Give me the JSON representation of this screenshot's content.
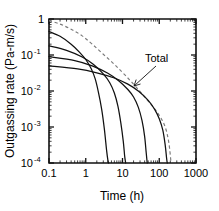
{
  "chart_data": {
    "type": "line",
    "title": "",
    "xlabel": "Time (h)",
    "ylabel": "Outgassing rate (Pa-m/s)",
    "xscale": "log",
    "yscale": "log",
    "xlim": [
      0.1,
      1000
    ],
    "ylim": [
      0.0001,
      1
    ],
    "grid": false,
    "legend": "none",
    "xticks": [
      "0.1",
      "1",
      "10",
      "100",
      "1000"
    ],
    "xtick_values": [
      0.1,
      1,
      10,
      100,
      1000
    ],
    "ytick_labels": [
      "1",
      "10",
      "10",
      "10",
      "10"
    ],
    "ytick_exponents": [
      "",
      "-1",
      "-2",
      "-3",
      "-4"
    ],
    "ytick_values": [
      1,
      0.1,
      0.01,
      0.001,
      0.0001
    ],
    "annotations": [
      {
        "text": "Total",
        "points_to": "dashed total curve",
        "x": 30,
        "y": 0.028
      }
    ],
    "series": [
      {
        "name": "Total",
        "style": "dashed",
        "color": "#7a7a7a",
        "x": [
          0.1,
          0.2,
          0.4,
          0.8,
          1.5,
          3,
          6,
          12,
          25,
          50,
          90,
          140,
          180,
          210
        ],
        "y": [
          0.9,
          0.72,
          0.52,
          0.34,
          0.2,
          0.105,
          0.055,
          0.027,
          0.012,
          0.0052,
          0.0025,
          0.0011,
          0.0004,
          0.0001
        ]
      },
      {
        "name": "component-1",
        "style": "solid",
        "color": "#111111",
        "x": [
          0.1,
          0.2,
          0.4,
          0.7,
          1.0,
          1.4,
          1.8,
          2.2,
          2.7,
          3.2,
          3.7,
          4.0,
          4.2
        ],
        "y": [
          0.45,
          0.33,
          0.2,
          0.115,
          0.075,
          0.042,
          0.022,
          0.0095,
          0.0032,
          0.0009,
          0.00022,
          0.00012,
          0.0001
        ]
      },
      {
        "name": "component-2",
        "style": "solid",
        "color": "#111111",
        "x": [
          0.1,
          0.3,
          0.8,
          1.6,
          3.0,
          4.5,
          6.0,
          7.5,
          9.0,
          10.5,
          11.5,
          12.2
        ],
        "y": [
          0.18,
          0.135,
          0.088,
          0.055,
          0.03,
          0.017,
          0.0088,
          0.0038,
          0.0013,
          0.0004,
          0.00015,
          0.0001
        ]
      },
      {
        "name": "component-3",
        "style": "solid",
        "color": "#111111",
        "x": [
          0.1,
          0.5,
          1.5,
          4.0,
          8.0,
          14.0,
          20.0,
          27.0,
          34.0,
          40.0,
          44.0,
          47.0
        ],
        "y": [
          0.09,
          0.07,
          0.05,
          0.031,
          0.019,
          0.011,
          0.0068,
          0.0035,
          0.0015,
          0.00055,
          0.0002,
          0.0001
        ]
      },
      {
        "name": "component-4",
        "style": "solid",
        "color": "#111111",
        "x": [
          0.1,
          0.6,
          2.0,
          6.0,
          14.0,
          28.0,
          50.0,
          75.0,
          100.0,
          125.0,
          145.0,
          158.0,
          165.0
        ],
        "y": [
          0.05,
          0.041,
          0.032,
          0.023,
          0.0155,
          0.0097,
          0.0055,
          0.0031,
          0.0017,
          0.00082,
          0.00032,
          0.00014,
          0.0001
        ]
      }
    ]
  },
  "axes": {
    "x_title": "Time (h)",
    "y_title": "Outgassing rate (Pa-m/s)"
  },
  "labels": {
    "total": "Total"
  }
}
